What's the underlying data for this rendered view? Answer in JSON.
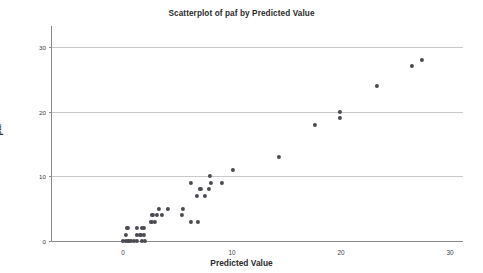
{
  "chart_data": {
    "type": "scatter",
    "title": "Scatterplot of paf by Predicted Value",
    "xlabel": "Predicted Value",
    "ylabel": "paf",
    "xlim": [
      -3.5,
      34
    ],
    "ylim": [
      -0.9,
      32.5
    ],
    "xticks": [
      0,
      10,
      20,
      30
    ],
    "yticks": [
      0,
      10,
      20,
      30
    ],
    "grid": "horizontal",
    "legend": "none",
    "marker_color": "#4a4a52",
    "axis_color": "#8a8a8a",
    "gridline_color": "#c9c9c9",
    "points": [
      {
        "x": 0.0,
        "y": 0.0
      },
      {
        "x": 0.3,
        "y": 0.0
      },
      {
        "x": 0.5,
        "y": 0.0
      },
      {
        "x": 0.7,
        "y": 0.0
      },
      {
        "x": 1.0,
        "y": 0.0
      },
      {
        "x": 1.3,
        "y": 0.0
      },
      {
        "x": 1.7,
        "y": 0.0
      },
      {
        "x": 2.0,
        "y": 0.0
      },
      {
        "x": 0.3,
        "y": 1.0
      },
      {
        "x": 1.3,
        "y": 1.0
      },
      {
        "x": 1.6,
        "y": 1.0
      },
      {
        "x": 1.9,
        "y": 1.0
      },
      {
        "x": 0.4,
        "y": 2.0
      },
      {
        "x": 1.3,
        "y": 2.0
      },
      {
        "x": 1.7,
        "y": 2.0
      },
      {
        "x": 1.9,
        "y": 2.0
      },
      {
        "x": 2.6,
        "y": 3.0
      },
      {
        "x": 2.9,
        "y": 3.0
      },
      {
        "x": 2.7,
        "y": 4.0
      },
      {
        "x": 3.1,
        "y": 4.0
      },
      {
        "x": 3.6,
        "y": 4.0
      },
      {
        "x": 5.4,
        "y": 4.0
      },
      {
        "x": 3.3,
        "y": 5.0
      },
      {
        "x": 4.1,
        "y": 5.0
      },
      {
        "x": 5.5,
        "y": 5.0
      },
      {
        "x": 6.2,
        "y": 3.0
      },
      {
        "x": 6.9,
        "y": 3.0
      },
      {
        "x": 6.8,
        "y": 7.0
      },
      {
        "x": 7.5,
        "y": 7.0
      },
      {
        "x": 7.1,
        "y": 8.0
      },
      {
        "x": 7.9,
        "y": 8.0
      },
      {
        "x": 6.2,
        "y": 9.0
      },
      {
        "x": 8.1,
        "y": 9.0
      },
      {
        "x": 9.1,
        "y": 9.0
      },
      {
        "x": 8.0,
        "y": 10.0
      },
      {
        "x": 10.1,
        "y": 11.0
      },
      {
        "x": 14.3,
        "y": 13.0
      },
      {
        "x": 17.6,
        "y": 18.0
      },
      {
        "x": 19.9,
        "y": 19.0
      },
      {
        "x": 19.9,
        "y": 20.0
      },
      {
        "x": 23.3,
        "y": 24.0
      },
      {
        "x": 26.5,
        "y": 27.0
      },
      {
        "x": 27.4,
        "y": 28.0
      }
    ]
  }
}
